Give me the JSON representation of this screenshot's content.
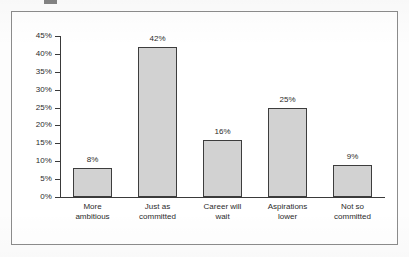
{
  "page": {
    "background_color": "#ffffff",
    "frame_border_color": "#8c8c8c"
  },
  "chart_data": {
    "type": "bar",
    "title": "",
    "subtitle": "",
    "xlabel": "",
    "ylabel": "",
    "categories": [
      "More ambitious",
      "Just as committed",
      "Career will wait",
      "Aspirations lower",
      "Not so committed"
    ],
    "category_lines": [
      [
        "More",
        "ambitious"
      ],
      [
        "Just as",
        "committed"
      ],
      [
        "Career will",
        "wait"
      ],
      [
        "Aspirations",
        "lower"
      ],
      [
        "Not so",
        "committed"
      ]
    ],
    "values": [
      8,
      42,
      16,
      25,
      9
    ],
    "value_labels": [
      "8%",
      "42%",
      "16%",
      "25%",
      "9%"
    ],
    "ylim": [
      0,
      45
    ],
    "ytick_values": [
      45,
      40,
      35,
      30,
      25,
      20,
      15,
      10,
      5,
      0
    ],
    "ytick_labels": [
      "45%",
      "40%",
      "35%",
      "30%",
      "25%",
      "20%",
      "15%",
      "10%",
      "5%",
      "0%"
    ],
    "grid": false,
    "legend": null,
    "legend_position": "none",
    "bar_fill_color": "#d2d2d2",
    "bar_border_color": "#3d3d3d",
    "axis_color": "#3a3a3a",
    "text_color": "#2b2b2b"
  }
}
